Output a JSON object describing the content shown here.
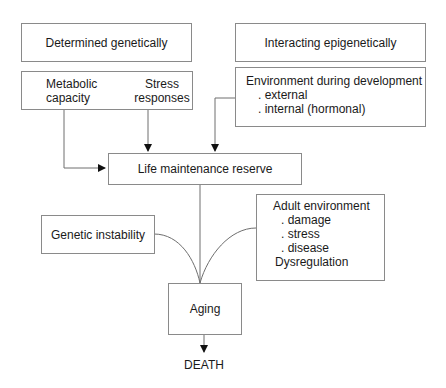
{
  "diagram": {
    "boxes": {
      "determined": {
        "label": "Determined genetically"
      },
      "metabolic": {
        "col1_line1": "Metabolic",
        "col1_line2": "capacity",
        "col2_line1": "Stress",
        "col2_line2": "responses"
      },
      "interacting": {
        "label": "Interacting epigenetically"
      },
      "environment_dev": {
        "title": "Environment during development",
        "items": [
          ". external",
          ". internal (hormonal)"
        ]
      },
      "life_reserve": {
        "label": "Life maintenance reserve"
      },
      "genetic_instability": {
        "label": "Genetic instability"
      },
      "adult_env": {
        "title": "Adult environment",
        "items": [
          ". damage",
          ". stress",
          ". disease"
        ],
        "footer": "Dysregulation"
      },
      "aging": {
        "label": "Aging"
      }
    },
    "terminal": {
      "label": "DEATH"
    },
    "colors": {
      "line": "#6e6e6e",
      "border": "#8a8a8a",
      "arrow": "#111111"
    }
  }
}
